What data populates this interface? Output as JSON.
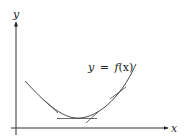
{
  "diagram": {
    "axes": {
      "x_label": "x",
      "y_label": "y",
      "color": "#333333"
    },
    "curve": {
      "label": "y = f(x)",
      "label_parts": {
        "lhs": "y",
        "eq": "=",
        "func": "f",
        "arg": "(x)"
      },
      "description": "convex upward curve (parabola-like) with tangent lines drawn at several points",
      "color": "#333333"
    },
    "tangents": [
      {
        "position": "left descending slope"
      },
      {
        "position": "minimum (horizontal)"
      },
      {
        "position": "just right of minimum"
      },
      {
        "position": "right ascending slope"
      }
    ]
  }
}
